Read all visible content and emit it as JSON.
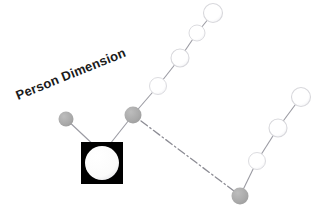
{
  "diagram": {
    "title_label": "Person Dimension",
    "title_rotation_deg": -22,
    "title_anchor": {
      "x": 18,
      "y": 100
    },
    "colors": {
      "accent_gray": "#a8a8a8",
      "node_light_fill": "#ffffff",
      "node_light_stroke": "#d8d8dc",
      "edge_stroke": "#9a9aa2",
      "square_fill": "#000000",
      "square_inner_fill": "#ffffff",
      "text": "#1a1a1a",
      "background": "#ffffff",
      "dashed_stroke": "#8d8d95"
    },
    "nodes": [
      {
        "id": "root-square",
        "type": "square-node",
        "x": 102,
        "y": 163,
        "size": 42,
        "inner_radius": 17,
        "fill": "#000000",
        "inner_fill": "#ffffff"
      },
      {
        "id": "gray-left",
        "type": "gray-node",
        "x": 66,
        "y": 119,
        "r": 7.5,
        "fill": "#a8a8a8"
      },
      {
        "id": "gray-center",
        "type": "gray-node",
        "x": 133,
        "y": 115,
        "r": 8.5,
        "fill": "#a8a8a8"
      },
      {
        "id": "gray-bottom-right",
        "type": "gray-node",
        "x": 240,
        "y": 196,
        "r": 8.5,
        "fill": "#a8a8a8"
      },
      {
        "id": "light-up-1",
        "type": "light-node",
        "x": 158,
        "y": 86,
        "r": 8.5,
        "fill": "#ffffff"
      },
      {
        "id": "light-up-2",
        "type": "light-node",
        "x": 180,
        "y": 58,
        "r": 9.0,
        "fill": "#ffffff"
      },
      {
        "id": "light-up-3",
        "type": "light-node",
        "x": 197,
        "y": 33,
        "r": 8.0,
        "fill": "#ffffff"
      },
      {
        "id": "light-up-4",
        "type": "light-node",
        "x": 213,
        "y": 13,
        "r": 9.5,
        "fill": "#ffffff"
      },
      {
        "id": "light-dr-1",
        "type": "light-node",
        "x": 257,
        "y": 161,
        "r": 8.5,
        "fill": "#ffffff"
      },
      {
        "id": "light-dr-2",
        "type": "light-node",
        "x": 278,
        "y": 128,
        "r": 9.0,
        "fill": "#ffffff"
      },
      {
        "id": "light-dr-3",
        "type": "light-node",
        "x": 301,
        "y": 97,
        "r": 9.5,
        "fill": "#ffffff"
      }
    ],
    "edges": [
      {
        "id": "edge-grayleft-square",
        "from": "gray-left",
        "to": "root-square",
        "style": "solid"
      },
      {
        "id": "edge-square-graycenter",
        "from": "root-square",
        "to": "gray-center",
        "style": "solid"
      },
      {
        "id": "edge-graycenter-up1",
        "from": "gray-center",
        "to": "light-up-1",
        "style": "solid"
      },
      {
        "id": "edge-up1-up2",
        "from": "light-up-1",
        "to": "light-up-2",
        "style": "solid"
      },
      {
        "id": "edge-up2-up3",
        "from": "light-up-2",
        "to": "light-up-3",
        "style": "solid"
      },
      {
        "id": "edge-up3-up4",
        "from": "light-up-3",
        "to": "light-up-4",
        "style": "solid"
      },
      {
        "id": "edge-graycenter-graybottom",
        "from": "gray-center",
        "to": "gray-bottom-right",
        "style": "dash-dot"
      },
      {
        "id": "edge-graybottom-dr1",
        "from": "gray-bottom-right",
        "to": "light-dr-1",
        "style": "solid"
      },
      {
        "id": "edge-dr1-dr2",
        "from": "light-dr-1",
        "to": "light-dr-2",
        "style": "solid"
      },
      {
        "id": "edge-dr2-dr3",
        "from": "light-dr-2",
        "to": "light-dr-3",
        "style": "solid"
      }
    ]
  }
}
